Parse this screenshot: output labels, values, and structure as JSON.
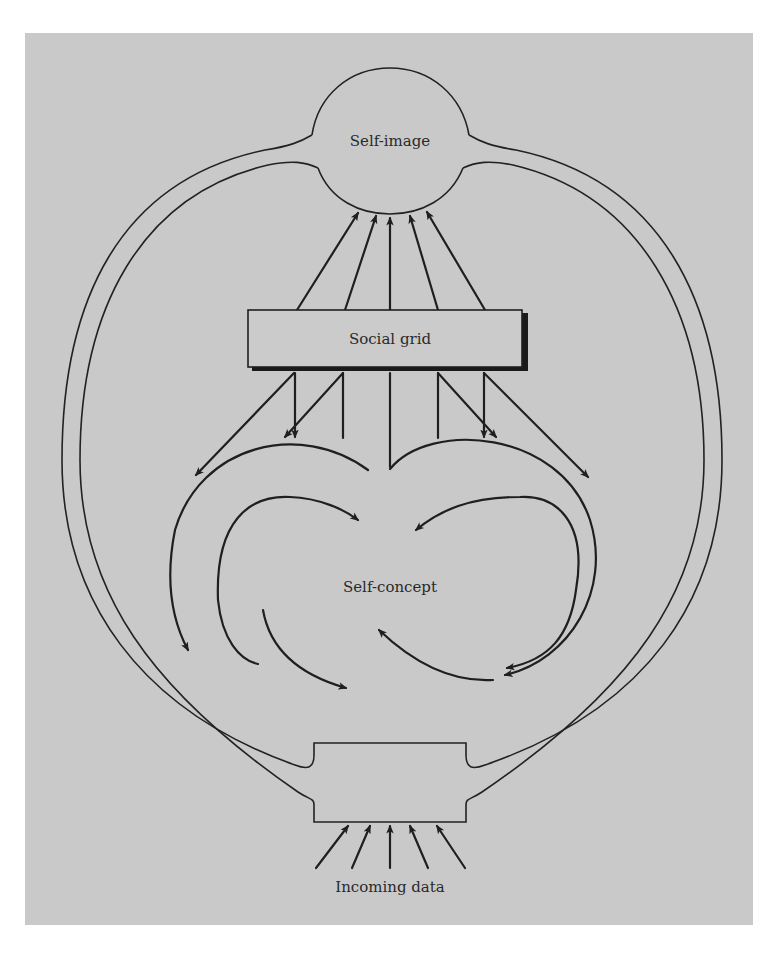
{
  "diagram": {
    "nodes": {
      "self_image": {
        "label": "Self-image"
      },
      "social_grid": {
        "label": "Social grid"
      },
      "self_concept": {
        "label": "Self-concept"
      },
      "incoming_data": {
        "label": "Incoming data"
      }
    },
    "edges": [
      {
        "from": "social_grid",
        "to": "self_image",
        "count": 5
      },
      {
        "from": "social_grid",
        "to": "self_concept",
        "count": 6
      },
      {
        "from": "incoming_data",
        "to": "input_box",
        "count": 5
      },
      {
        "from": "self_concept",
        "to": "self_concept",
        "type": "circular feedback loops"
      },
      {
        "from": "input_box",
        "to": "self_image",
        "type": "outer ring channel"
      }
    ],
    "colors": {
      "background": "#c9c9c9",
      "line": "#1f1f1f",
      "text": "#2a2a2a"
    }
  }
}
